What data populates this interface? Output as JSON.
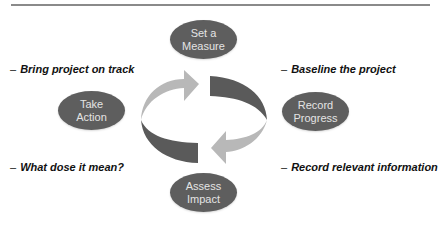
{
  "diagram": {
    "type": "cycle",
    "colors": {
      "node_fill": "#5e5e5e",
      "node_text": "#e4e4e4",
      "arrow_light": "#b8b8b8",
      "arrow_dark": "#5a5a5a",
      "rule": "#8a8a8a"
    },
    "nodes": [
      {
        "id": "set-measure",
        "line1": "Set a",
        "line2": "Measure"
      },
      {
        "id": "record-progress",
        "line1": "Record",
        "line2": "Progress"
      },
      {
        "id": "assess-impact",
        "line1": "Assess",
        "line2": "Impact"
      },
      {
        "id": "take-action",
        "line1": "Take",
        "line2": "Action"
      }
    ],
    "notes": {
      "top_left": {
        "dash": "–",
        "text": "Bring project on track"
      },
      "top_right": {
        "dash": "–",
        "text": "Baseline the project"
      },
      "bottom_left": {
        "dash": "–",
        "text": "What dose it mean?"
      },
      "bottom_right": {
        "dash": "–",
        "text": "Record relevant information"
      }
    }
  }
}
